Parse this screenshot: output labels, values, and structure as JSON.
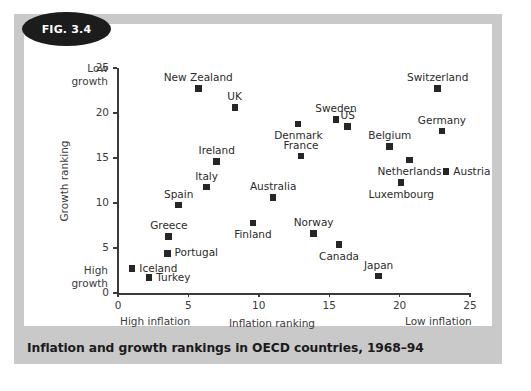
{
  "figure": {
    "badge_label": "FIG. 3.4",
    "caption": "Inflation and growth rankings in OECD countries, 1968–94"
  },
  "annotations": {
    "low_growth": "Low\ngrowth",
    "low_growth_line1": "Low",
    "low_growth_line2": "growth",
    "high_growth_line1": "High",
    "high_growth_line2": "growth",
    "high_inflation": "High inflation",
    "low_inflation": "Low inflation"
  },
  "chart_data": {
    "type": "scatter",
    "title": "Inflation and growth rankings in OECD countries, 1968–94",
    "xlabel": "Inflation ranking",
    "ylabel": "Growth ranking",
    "xlim": [
      0,
      25
    ],
    "ylim": [
      0,
      25
    ],
    "xticks": [
      0,
      5,
      10,
      15,
      20,
      25
    ],
    "yticks": [
      0,
      5,
      10,
      15,
      20,
      25
    ],
    "grid": false,
    "legend": false,
    "marker_color": "#262626",
    "marker_shape": "square",
    "axis_notes": {
      "y_top": "Low growth",
      "y_bottom": "High growth",
      "x_left": "High inflation",
      "x_right": "Low inflation"
    },
    "points": [
      {
        "label": "Iceland",
        "x": 1.0,
        "y": 2.7,
        "label_pos": "right"
      },
      {
        "label": "Turkey",
        "x": 2.2,
        "y": 1.7,
        "label_pos": "right"
      },
      {
        "label": "Portugal",
        "x": 3.5,
        "y": 4.4,
        "label_pos": "right"
      },
      {
        "label": "Greece",
        "x": 3.6,
        "y": 6.3,
        "label_pos": "above"
      },
      {
        "label": "Spain",
        "x": 4.3,
        "y": 9.8,
        "label_pos": "above"
      },
      {
        "label": "New Zealand",
        "x": 5.7,
        "y": 22.7,
        "label_pos": "above"
      },
      {
        "label": "Italy",
        "x": 6.3,
        "y": 11.8,
        "label_pos": "above"
      },
      {
        "label": "Ireland",
        "x": 7.0,
        "y": 14.6,
        "label_pos": "above"
      },
      {
        "label": "UK",
        "x": 8.3,
        "y": 20.6,
        "label_pos": "above"
      },
      {
        "label": "Finland",
        "x": 9.6,
        "y": 7.8,
        "label_pos": "below"
      },
      {
        "label": "Australia",
        "x": 11.0,
        "y": 10.6,
        "label_pos": "above"
      },
      {
        "label": "Denmark",
        "x": 12.8,
        "y": 18.8,
        "label_pos": "below"
      },
      {
        "label": "France",
        "x": 13.0,
        "y": 15.2,
        "label_pos": "above"
      },
      {
        "label": "Norway",
        "x": 13.9,
        "y": 6.6,
        "label_pos": "above"
      },
      {
        "label": "Sweden",
        "x": 15.5,
        "y": 19.3,
        "label_pos": "above"
      },
      {
        "label": "Canada",
        "x": 15.7,
        "y": 5.4,
        "label_pos": "below"
      },
      {
        "label": "US",
        "x": 16.3,
        "y": 18.5,
        "label_pos": "above"
      },
      {
        "label": "Japan",
        "x": 18.5,
        "y": 1.9,
        "label_pos": "above"
      },
      {
        "label": "Belgium",
        "x": 19.3,
        "y": 16.3,
        "label_pos": "above"
      },
      {
        "label": "Luxembourg",
        "x": 20.1,
        "y": 12.3,
        "label_pos": "below"
      },
      {
        "label": "Netherlands",
        "x": 20.7,
        "y": 14.8,
        "label_pos": "below"
      },
      {
        "label": "Switzerland",
        "x": 22.7,
        "y": 22.7,
        "label_pos": "above"
      },
      {
        "label": "Germany",
        "x": 23.0,
        "y": 18.0,
        "label_pos": "above"
      },
      {
        "label": "Austria",
        "x": 23.3,
        "y": 13.5,
        "label_pos": "right"
      }
    ]
  }
}
